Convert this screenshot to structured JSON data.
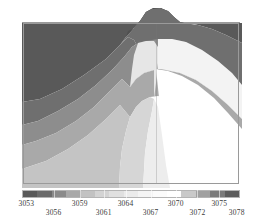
{
  "figure": {
    "kind": "filled-contour-terrain-plot",
    "background_color": "#ffffff",
    "frame_color": "#9a9a9a"
  },
  "colorbar": {
    "orientation": "horizontal",
    "min": 3053,
    "max": 3078,
    "units": "",
    "border_color": "#b4b4b4",
    "segments": [
      "#595959",
      "#6b6b6b",
      "#8a8a8a",
      "#a8a8a8",
      "#c2c2c2",
      "#d3d3d3",
      "#e0e0e0",
      "#ebebeb",
      "#f4f4f4",
      "#fbfbfb",
      "#ffffff",
      "#c9c9c9",
      "#a0a0a0",
      "#7a7a7a",
      "#5c5c5c"
    ],
    "tick_labels_row_a": [
      {
        "text": "3053",
        "pos": 0.02
      },
      {
        "text": "3059",
        "pos": 0.265
      },
      {
        "text": "3064",
        "pos": 0.475
      },
      {
        "text": "3070",
        "pos": 0.705
      },
      {
        "text": "3075",
        "pos": 0.905
      }
    ],
    "tick_labels_row_b": [
      {
        "text": "3056",
        "pos": 0.145
      },
      {
        "text": "3061",
        "pos": 0.375
      },
      {
        "text": "3067",
        "pos": 0.59
      },
      {
        "text": "3072",
        "pos": 0.805
      },
      {
        "text": "3078",
        "pos": 0.985
      }
    ]
  },
  "chart_data": {
    "type": "heatmap",
    "title": "",
    "subtitle": "",
    "xlabel": "",
    "ylabel": "",
    "xticklabels": [],
    "yticklabels": [],
    "grid": false,
    "legend_position": "bottom",
    "colormap": "grayscale",
    "colorbar_label": "",
    "vmin": 3053,
    "vmax": 3078,
    "colorbar_ticks": [
      3053,
      3056,
      3059,
      3061,
      3064,
      3067,
      3070,
      3072,
      3075,
      3078
    ],
    "contour_levels": [
      3053,
      3056,
      3059,
      3061,
      3064,
      3067,
      3070,
      3072,
      3075,
      3078
    ],
    "band_fills": [
      {
        "level_low": 3053,
        "level_high": 3056,
        "color": "#595959",
        "where": "upper-left and upper-right corners, summit cap"
      },
      {
        "level_low": 3056,
        "level_high": 3059,
        "color": "#6b6b6b",
        "where": "upper band below the dark corners"
      },
      {
        "level_low": 3059,
        "level_high": 3061,
        "color": "#8a8a8a",
        "where": "left mid-slope and right mid-slope"
      },
      {
        "level_low": 3061,
        "level_high": 3064,
        "color": "#a8a8a8",
        "where": "broad mid flank"
      },
      {
        "level_low": 3064,
        "level_high": 3067,
        "color": "#c2c2c2",
        "where": "lower-left apron"
      },
      {
        "level_low": 3067,
        "level_high": 3070,
        "color": "#d3d3d3",
        "where": "left of central ridge"
      },
      {
        "level_low": 3070,
        "level_high": 3072,
        "color": "#e4e4e4",
        "where": "central ridge body"
      },
      {
        "level_low": 3072,
        "level_high": 3075,
        "color": "#f2f2f2",
        "where": "right of central ridge"
      },
      {
        "level_low": 3075,
        "level_high": 3078,
        "color": "#ffffff",
        "where": "brightest lobe on right flank"
      }
    ],
    "series": [
      {
        "name": "elevation",
        "values": [
          3053,
          3056,
          3059,
          3061,
          3064,
          3067,
          3070,
          3072,
          3075,
          3078
        ]
      }
    ]
  }
}
